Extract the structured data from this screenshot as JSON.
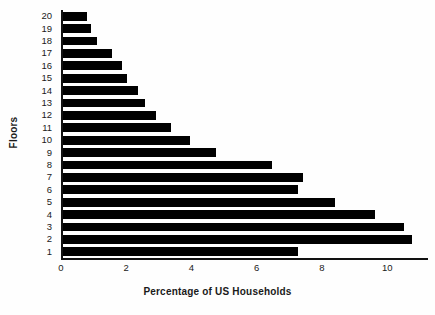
{
  "chart_data": {
    "type": "bar",
    "orientation": "horizontal",
    "title": "",
    "xlabel": "Percentage of US Households",
    "ylabel": "Floors",
    "categories": [
      "20",
      "19",
      "18",
      "17",
      "16",
      "15",
      "14",
      "13",
      "12",
      "11",
      "10",
      "9",
      "8",
      "7",
      "6",
      "5",
      "4",
      "3",
      "2",
      "1"
    ],
    "values": [
      0.73,
      0.85,
      1.05,
      1.5,
      1.8,
      1.95,
      2.3,
      2.5,
      2.85,
      3.3,
      3.9,
      4.7,
      6.4,
      7.35,
      7.2,
      8.35,
      9.55,
      10.45,
      10.7,
      7.2
    ],
    "xlim": [
      0,
      11.25
    ],
    "xticks": [
      0,
      2,
      4,
      6,
      8,
      10
    ],
    "xtick_labels": [
      "0",
      "2",
      "4",
      "6",
      "8",
      "10"
    ],
    "grid": false,
    "legend": false,
    "bar_color": "#000000",
    "axis_color": "#111111",
    "background": "#fefefe"
  }
}
